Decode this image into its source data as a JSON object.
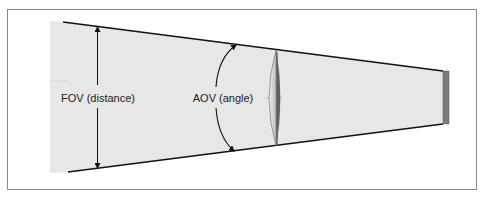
{
  "diagram": {
    "labels": {
      "fov": "FOV (distance)",
      "aov": "AOV (angle)"
    },
    "colors": {
      "frame": "#888888",
      "field_fill": "#e6e6e6",
      "line": "#111111",
      "sensor": "#7a7a7a",
      "lens_light": "#d8d8d8",
      "lens_dark": "#555555"
    },
    "elements": [
      "frame",
      "field-of-view-region",
      "fov-arrow",
      "aov-arc-arrow",
      "lens",
      "sensor"
    ]
  }
}
